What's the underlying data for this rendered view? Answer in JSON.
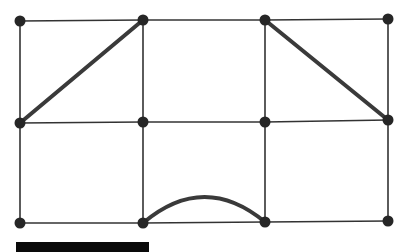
{
  "diagram": {
    "type": "grid-graph",
    "colors": {
      "line": "#333333",
      "thick": "#3a3a3a",
      "node": "#262626",
      "bar": "#0a0a0a",
      "background": "#ffffff"
    },
    "nodes": [
      {
        "id": "n00",
        "x": 20,
        "y": 21
      },
      {
        "id": "n01",
        "x": 143,
        "y": 20
      },
      {
        "id": "n02",
        "x": 265,
        "y": 20
      },
      {
        "id": "n03",
        "x": 388,
        "y": 19
      },
      {
        "id": "n10",
        "x": 20,
        "y": 123
      },
      {
        "id": "n11",
        "x": 143,
        "y": 122
      },
      {
        "id": "n12",
        "x": 265,
        "y": 122
      },
      {
        "id": "n13",
        "x": 388,
        "y": 120
      },
      {
        "id": "n20",
        "x": 20,
        "y": 223
      },
      {
        "id": "n21",
        "x": 143,
        "y": 223
      },
      {
        "id": "n22",
        "x": 265,
        "y": 222
      },
      {
        "id": "n23",
        "x": 388,
        "y": 221
      }
    ],
    "thin_edges": [
      [
        "n00",
        "n01"
      ],
      [
        "n01",
        "n02"
      ],
      [
        "n02",
        "n03"
      ],
      [
        "n10",
        "n11"
      ],
      [
        "n11",
        "n12"
      ],
      [
        "n12",
        "n13"
      ],
      [
        "n20",
        "n21"
      ],
      [
        "n21",
        "n22"
      ],
      [
        "n22",
        "n23"
      ],
      [
        "n00",
        "n10"
      ],
      [
        "n10",
        "n20"
      ],
      [
        "n01",
        "n11"
      ],
      [
        "n11",
        "n21"
      ],
      [
        "n02",
        "n12"
      ],
      [
        "n12",
        "n22"
      ],
      [
        "n03",
        "n13"
      ],
      [
        "n13",
        "n23"
      ]
    ],
    "thick_edges": [
      [
        "n10",
        "n01"
      ],
      [
        "n02",
        "n13"
      ]
    ],
    "arcs": [
      {
        "from": "n21",
        "to": "n22",
        "peak_y": 197
      }
    ],
    "scale_bar": {
      "x": 16,
      "y": 242,
      "width": 133,
      "height": 10
    }
  }
}
